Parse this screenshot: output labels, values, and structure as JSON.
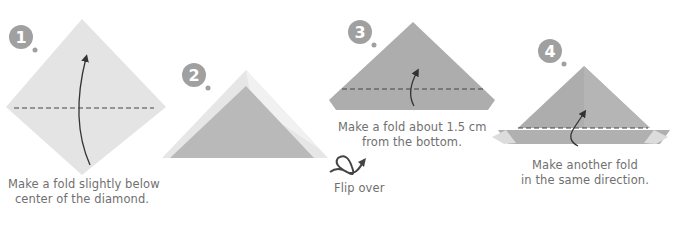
{
  "steps": [
    {
      "number": "1",
      "caption_line1": "Make a fold slightly below",
      "caption_line2": "center of the diamond."
    },
    {
      "number": "2"
    },
    {
      "number": "3",
      "caption_line1": "Make a fold about 1.5 cm",
      "caption_line2": "from the bottom.",
      "flip_label": "Flip over"
    },
    {
      "number": "4",
      "caption_line1": "Make another fold",
      "caption_line2": "in the same direction."
    }
  ],
  "colors": {
    "paper_light": "#e3e3e3",
    "paper_mid": "#b9b9b9",
    "paper_dark": "#a8a8a8",
    "badge": "#a0a0a0",
    "line": "#3a3a3a",
    "text": "#707070"
  }
}
